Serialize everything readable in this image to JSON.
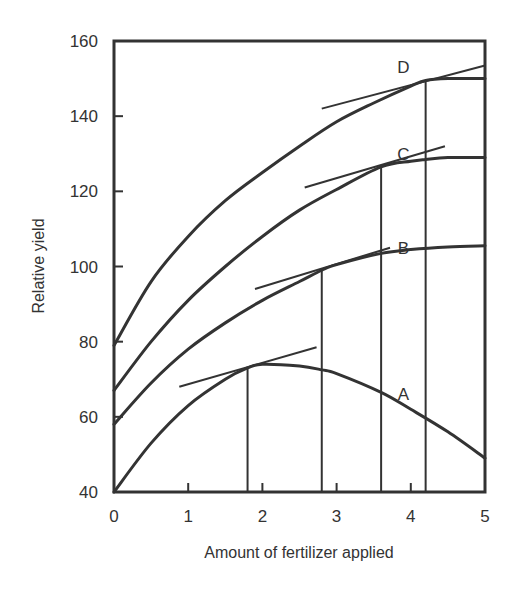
{
  "chart_data": {
    "type": "line",
    "title": "",
    "xlabel": "Amount of fertilizer applied",
    "ylabel": "Relative yield",
    "xlim": [
      0,
      5
    ],
    "ylim": [
      40,
      160
    ],
    "x_ticks": [
      0,
      1,
      2,
      3,
      4,
      5
    ],
    "y_ticks": [
      40,
      60,
      80,
      100,
      120,
      140,
      160
    ],
    "grid": false,
    "legend": "none (curves labeled directly A, B, C, D)",
    "series": [
      {
        "name": "A",
        "x": [
          0,
          0.5,
          1,
          1.5,
          1.8,
          2,
          2.5,
          2.8,
          3,
          3.6,
          4,
          4.5,
          5
        ],
        "y": [
          40,
          53,
          63,
          70,
          73,
          74,
          73.5,
          72.5,
          71.5,
          66.5,
          62,
          56,
          49
        ],
        "label_pos": [
          3.9,
          66
        ],
        "tangent": {
          "from": [
            0.88,
            68
          ],
          "to": [
            2.73,
            78.5
          ]
        },
        "optimum_x": 1.8
      },
      {
        "name": "B",
        "x": [
          0,
          0.5,
          1,
          1.5,
          2,
          2.5,
          2.8,
          3,
          3.6,
          4,
          4.5,
          5
        ],
        "y": [
          58,
          69,
          78,
          85,
          91,
          96,
          99,
          100.5,
          103.5,
          104.5,
          105.2,
          105.5
        ],
        "label_pos": [
          3.9,
          105
        ],
        "tangent": {
          "from": [
            1.9,
            94
          ],
          "to": [
            3.72,
            105
          ]
        },
        "optimum_x": 2.8
      },
      {
        "name": "C",
        "x": [
          0,
          0.5,
          1,
          1.5,
          2,
          2.5,
          3,
          3.6,
          4,
          4.2,
          4.5,
          5
        ],
        "y": [
          67,
          80,
          91,
          100,
          108,
          115,
          120.5,
          126.5,
          128,
          128.5,
          129,
          129
        ],
        "label_pos": [
          3.9,
          130
        ],
        "tangent": {
          "from": [
            2.57,
            121
          ],
          "to": [
            4.46,
            132
          ]
        },
        "optimum_x": 3.6
      },
      {
        "name": "D",
        "x": [
          0,
          0.5,
          1,
          1.5,
          2,
          2.5,
          3,
          3.5,
          4,
          4.2,
          4.5,
          5
        ],
        "y": [
          79,
          96,
          108,
          117.5,
          125,
          132,
          138.5,
          143.5,
          148,
          149.5,
          150,
          150
        ],
        "label_pos": [
          3.9,
          153
        ],
        "tangent": {
          "from": [
            2.8,
            142
          ],
          "to": [
            5,
            153.5
          ]
        },
        "optimum_x": 4.2
      }
    ]
  }
}
